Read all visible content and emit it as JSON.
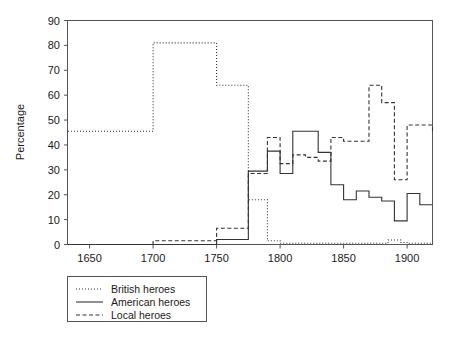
{
  "chart_data": {
    "type": "line",
    "title": "",
    "subtitle": "",
    "xlabel": "",
    "ylabel": "Percentage",
    "xlim": [
      1633,
      1920
    ],
    "ylim": [
      0,
      90
    ],
    "xticks": [
      1650,
      1700,
      1750,
      1800,
      1850,
      1900
    ],
    "yticks": [
      0,
      10,
      20,
      30,
      40,
      50,
      60,
      70,
      80,
      90
    ],
    "grid": false,
    "step_style": "post",
    "legend_position": "below-left",
    "series": [
      {
        "name": "British heroes",
        "style": "dotted",
        "color": "#333333",
        "x": [
          1633,
          1700,
          1750,
          1775,
          1790,
          1800,
          1810,
          1820,
          1830,
          1840,
          1850,
          1860,
          1870,
          1880,
          1885,
          1895,
          1900,
          1910,
          1920
        ],
        "values": [
          45.5,
          81,
          64,
          18,
          1.5,
          0.5,
          0.5,
          0.5,
          0.5,
          0.5,
          0.5,
          0.5,
          0.5,
          0.5,
          1.8,
          0.8,
          0.5,
          0.5,
          0.5
        ]
      },
      {
        "name": "American heroes",
        "style": "solid",
        "color": "#333333",
        "x": [
          1633,
          1700,
          1750,
          1775,
          1790,
          1800,
          1810,
          1820,
          1830,
          1840,
          1850,
          1860,
          1870,
          1880,
          1890,
          1900,
          1910,
          1920
        ],
        "values": [
          0,
          0,
          2,
          29.5,
          37.5,
          28.5,
          45.5,
          45.5,
          37,
          24,
          18,
          21.5,
          19,
          17.5,
          9.5,
          20.5,
          16,
          16
        ]
      },
      {
        "name": "Local heroes",
        "style": "dashed",
        "color": "#333333",
        "x": [
          1633,
          1700,
          1750,
          1775,
          1790,
          1800,
          1810,
          1820,
          1830,
          1840,
          1850,
          1860,
          1870,
          1880,
          1890,
          1900,
          1910,
          1920
        ],
        "values": [
          0,
          1.5,
          6.5,
          28.5,
          43,
          32.5,
          36,
          35,
          33.5,
          43,
          41.5,
          41.5,
          64,
          57,
          26,
          48,
          48,
          45
        ]
      }
    ]
  },
  "axes": {
    "ylabel": "Percentage",
    "ytick_labels": [
      "0",
      "10",
      "20",
      "30",
      "40",
      "50",
      "60",
      "70",
      "80",
      "90"
    ],
    "xtick_labels": [
      "1650",
      "1700",
      "1750",
      "1800",
      "1850",
      "1900"
    ]
  },
  "legend": {
    "entries": [
      {
        "label": "British heroes",
        "style": "dotted"
      },
      {
        "label": "American heroes",
        "style": "solid"
      },
      {
        "label": "Local heroes",
        "style": "dashed"
      }
    ]
  }
}
